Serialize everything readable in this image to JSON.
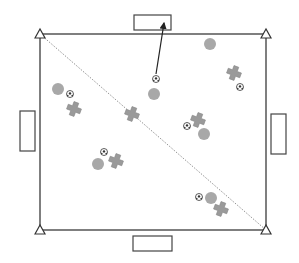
{
  "diagram": {
    "type": "soccer-drill-field",
    "colors": {
      "field_line": "#555555",
      "goal_stroke": "#444444",
      "player": "#a8a8a8",
      "cross": "#9a9a9a",
      "cross_stroke": "#888888",
      "ball": "#333333",
      "diagonal": "#777777",
      "cone_stroke": "#333333"
    },
    "field": {
      "x": 40,
      "y": 34,
      "w": 226,
      "h": 196
    },
    "cones": [
      {
        "x": 40,
        "y": 34
      },
      {
        "x": 266,
        "y": 34
      },
      {
        "x": 40,
        "y": 230
      },
      {
        "x": 266,
        "y": 230
      }
    ],
    "diagonal": {
      "x1": 40,
      "y1": 34,
      "x2": 266,
      "y2": 230
    },
    "goals": [
      {
        "name": "goal-top",
        "x": 134,
        "y": 15,
        "w": 37,
        "h": 15
      },
      {
        "name": "goal-bottom",
        "x": 133,
        "y": 236,
        "w": 39,
        "h": 15
      },
      {
        "name": "goal-left",
        "x": 20,
        "y": 111,
        "w": 15,
        "h": 40
      },
      {
        "name": "goal-right",
        "x": 271,
        "y": 114,
        "w": 15,
        "h": 40
      }
    ],
    "players": [
      {
        "x": 58,
        "y": 89
      },
      {
        "x": 210,
        "y": 44
      },
      {
        "x": 154,
        "y": 94
      },
      {
        "x": 98,
        "y": 164
      },
      {
        "x": 204,
        "y": 134
      },
      {
        "x": 211,
        "y": 198
      }
    ],
    "defenders": [
      {
        "x": 74,
        "y": 109
      },
      {
        "x": 132,
        "y": 114
      },
      {
        "x": 234,
        "y": 73
      },
      {
        "x": 198,
        "y": 120
      },
      {
        "x": 116,
        "y": 161
      },
      {
        "x": 221,
        "y": 209
      }
    ],
    "balls": [
      {
        "x": 70,
        "y": 94
      },
      {
        "x": 156,
        "y": 79
      },
      {
        "x": 240,
        "y": 87
      },
      {
        "x": 187,
        "y": 126
      },
      {
        "x": 104,
        "y": 152
      },
      {
        "x": 199,
        "y": 197
      }
    ],
    "arrows": [
      {
        "x1": 156,
        "y1": 74,
        "x2": 164,
        "y2": 23
      }
    ]
  }
}
